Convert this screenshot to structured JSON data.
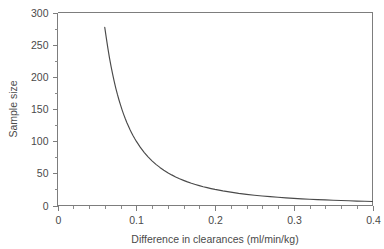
{
  "chart_data": {
    "type": "line",
    "title": "",
    "xlabel": "Difference in clearances (ml/min/kg)",
    "ylabel": "Sample size",
    "xlim": [
      0,
      0.4
    ],
    "ylim": [
      0,
      300
    ],
    "grid": false,
    "legend": "none",
    "frame": "box",
    "x_ticks_major": [
      "0",
      "0.1",
      "0.2",
      "0.3",
      "0.4"
    ],
    "x_ticks_major_values": [
      0,
      0.1,
      0.2,
      0.3,
      0.4
    ],
    "x_ticks_minor_values": [
      0.02,
      0.04,
      0.06,
      0.08,
      0.12,
      0.14,
      0.16,
      0.18,
      0.22,
      0.24,
      0.26,
      0.28,
      0.32,
      0.34,
      0.36,
      0.38
    ],
    "y_ticks_major": [
      "0",
      "50",
      "100",
      "150",
      "200",
      "250",
      "300"
    ],
    "y_ticks_major_values": [
      0,
      50,
      100,
      150,
      200,
      250,
      300
    ],
    "y_ticks_minor_values": [
      25,
      75,
      125,
      175,
      225,
      275
    ],
    "series": [
      {
        "name": "Required sample size",
        "relation": "n = 1 / d^2",
        "x": [
          0.06,
          0.062,
          0.064,
          0.066,
          0.068,
          0.07,
          0.072,
          0.074,
          0.076,
          0.078,
          0.08,
          0.082,
          0.084,
          0.086,
          0.088,
          0.09,
          0.092,
          0.094,
          0.096,
          0.098,
          0.1,
          0.105,
          0.11,
          0.115,
          0.12,
          0.125,
          0.13,
          0.135,
          0.14,
          0.145,
          0.15,
          0.155,
          0.16,
          0.165,
          0.17,
          0.175,
          0.18,
          0.185,
          0.19,
          0.195,
          0.2,
          0.21,
          0.22,
          0.23,
          0.24,
          0.25,
          0.26,
          0.27,
          0.28,
          0.29,
          0.3,
          0.31,
          0.32,
          0.33,
          0.34,
          0.35,
          0.36,
          0.37,
          0.38,
          0.39,
          0.4
        ],
        "y": [
          277.0,
          260.1,
          244.1,
          229.6,
          216.3,
          204.1,
          192.9,
          182.6,
          173.0,
          164.4,
          156.3,
          148.7,
          141.7,
          135.2,
          129.1,
          123.5,
          118.1,
          113.2,
          108.5,
          104.1,
          100.0,
          90.7,
          82.6,
          75.6,
          69.4,
          64.0,
          59.2,
          54.9,
          51.0,
          47.6,
          44.4,
          41.6,
          39.1,
          36.7,
          34.6,
          32.7,
          30.9,
          29.2,
          27.7,
          26.3,
          25.0,
          22.7,
          20.7,
          18.9,
          17.4,
          16.0,
          14.8,
          13.7,
          12.8,
          11.9,
          11.1,
          10.4,
          9.8,
          9.2,
          8.7,
          8.2,
          7.7,
          7.3,
          6.9,
          6.6,
          6.3
        ]
      }
    ],
    "annotations": []
  }
}
